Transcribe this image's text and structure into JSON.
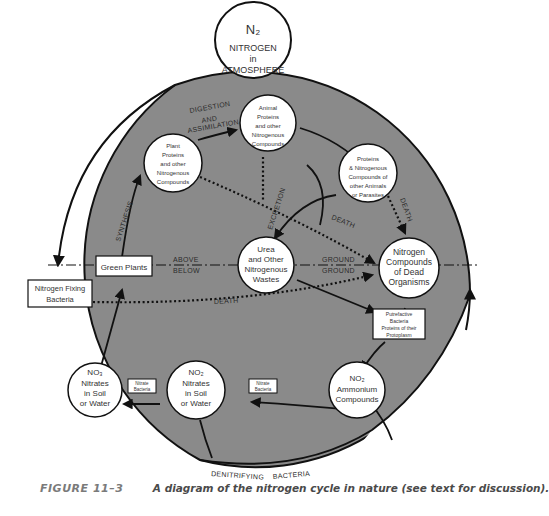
{
  "figure": {
    "number": "FIGURE 11–3",
    "caption": "A diagram of the nitrogen cycle in nature (see text for discussion)."
  },
  "colors": {
    "cycle_fill": "#8a8a8a",
    "outline": "#111111",
    "node_fill": "#ffffff",
    "text": "#333333",
    "caption_label": "#7a7a7a"
  },
  "nodes": {
    "atmosphere": {
      "formula": "N₂",
      "lines": [
        "NITROGEN",
        "in",
        "ATMOSPHERE"
      ]
    },
    "plant_proteins": {
      "lines": [
        "Plant",
        "Proteins",
        "and other",
        "Nitrogenous",
        "Compounds"
      ]
    },
    "animal_proteins": {
      "lines": [
        "Animal",
        "Proteins",
        "and other",
        "Nitrogenous",
        "Compounds"
      ]
    },
    "parasite_proteins": {
      "lines": [
        "Proteins",
        "& Nitrogenous",
        "Compounds of",
        "other Animals",
        "or Parasites"
      ]
    },
    "urea": {
      "lines": [
        "Urea",
        "and Other",
        "Nitrogenous",
        "Wastes"
      ]
    },
    "dead_organisms": {
      "lines": [
        "Nitrogen",
        "Compounds",
        "of Dead",
        "Organisms"
      ]
    },
    "ammonium": {
      "formula": "NO₂",
      "lines": [
        "Ammonium",
        "Compounds"
      ]
    },
    "nitrites": {
      "formula": "NO₂",
      "lines": [
        "Nitrates",
        "in Soil",
        "or Water"
      ]
    },
    "nitrates": {
      "formula": "NO₃",
      "lines": [
        "Nitrates",
        "in Soil",
        "or Water"
      ]
    }
  },
  "boxes": {
    "green_plants": "Green Plants",
    "nitrogen_fixing": [
      "Nitrogen Fixing",
      "Bacteria"
    ],
    "putrefactive": [
      "Putrefactive",
      "Bacteria",
      "Proteins of their",
      "Protoplasm"
    ],
    "nitrate_bacteria_left": [
      "Nitrate",
      "Bacteria"
    ],
    "nitrate_bacteria_right": [
      "Nitrate",
      "Bacteria"
    ]
  },
  "labels": {
    "digestion": [
      "DIGESTION",
      "AND",
      "ASSIMILATION"
    ],
    "synthesis": "SYNTHESIS",
    "excretion": "EXCRETION",
    "death_center": "DEATH",
    "death_right": "DEATH",
    "death_lower": "DEATH",
    "above": "ABOVE",
    "below": "BELOW",
    "ground_above": "GROUND",
    "ground_below": "GROUND",
    "denitrifying": "DENITRIFYING",
    "bacteria": "BACTERIA"
  }
}
